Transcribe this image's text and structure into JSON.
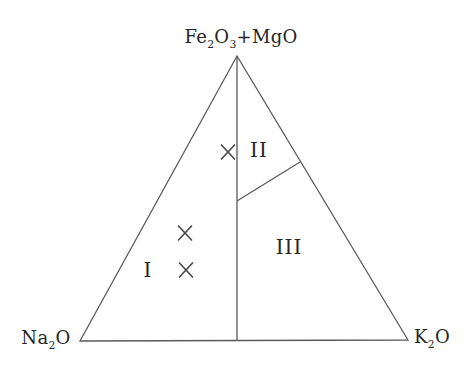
{
  "figure": {
    "width": 473,
    "height": 372,
    "background": "#ffffff",
    "line_color": "#5a5a5a",
    "marker_color": "#4d4d4d",
    "text_color": "#262626"
  },
  "chart_data": {
    "type": "scatter",
    "subtype": "ternary-composition-diagram",
    "title": "",
    "apexes": {
      "top": {
        "text": "Fe2O3+MgO",
        "parts": [
          {
            "t": "Fe"
          },
          {
            "t": "2",
            "sub": true
          },
          {
            "t": "O"
          },
          {
            "t": "3",
            "sub": true
          },
          {
            "t": "+MgO"
          }
        ],
        "vertex": {
          "x": 237,
          "y": 56
        },
        "label_pos": {
          "x": 241,
          "y": 37
        }
      },
      "bottom_left": {
        "text": "Na2O",
        "parts": [
          {
            "t": "Na"
          },
          {
            "t": "2",
            "sub": true
          },
          {
            "t": "O"
          }
        ],
        "vertex": {
          "x": 80,
          "y": 341
        },
        "label_pos": {
          "x": 46,
          "y": 338
        }
      },
      "bottom_right": {
        "text": "K2O",
        "parts": [
          {
            "t": "K"
          },
          {
            "t": "2",
            "sub": true
          },
          {
            "t": "O"
          }
        ],
        "vertex": {
          "x": 408,
          "y": 340
        },
        "label_pos": {
          "x": 432,
          "y": 337
        }
      }
    },
    "boundaries": [
      {
        "name": "median-line",
        "from": {
          "x": 237,
          "y": 56
        },
        "to": {
          "x": 237,
          "y": 341
        }
      },
      {
        "name": "region-II-III-divider",
        "from": {
          "x": 237,
          "y": 201
        },
        "to": {
          "x": 300,
          "y": 162
        }
      }
    ],
    "regions": [
      {
        "label": "I",
        "pos": {
          "x": 148,
          "y": 270
        }
      },
      {
        "label": "II",
        "pos": {
          "x": 259,
          "y": 150
        }
      },
      {
        "label": "III",
        "pos": {
          "x": 289,
          "y": 247
        }
      }
    ],
    "points": [
      {
        "marker": "x",
        "pos": {
          "x": 228,
          "y": 152
        },
        "approx_fractions": {
          "Fe2O3_MgO": 0.66,
          "Na2O": 0.2,
          "K2O": 0.14
        }
      },
      {
        "marker": "x",
        "pos": {
          "x": 185,
          "y": 233
        },
        "approx_fractions": {
          "Fe2O3_MgO": 0.38,
          "Na2O": 0.48,
          "K2O": 0.14
        }
      },
      {
        "marker": "x",
        "pos": {
          "x": 186,
          "y": 270
        },
        "approx_fractions": {
          "Fe2O3_MgO": 0.25,
          "Na2O": 0.55,
          "K2O": 0.2
        }
      }
    ],
    "marker_half_width": 6.5,
    "marker_half_height": 7,
    "legend": null,
    "grid": false
  }
}
